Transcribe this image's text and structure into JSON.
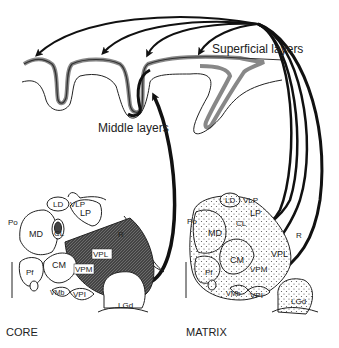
{
  "diagram": {
    "cortex_labels": {
      "superficial": "Superficial layers",
      "middle": "Middle layers"
    },
    "panels": {
      "core": {
        "title": "CORE",
        "nuclei": [
          "LD",
          "VLP",
          "Po",
          "LP",
          "MD",
          "CL",
          "R",
          "VPL",
          "CM",
          "VPM",
          "Pf",
          "VMb",
          "VPI",
          "LGd"
        ],
        "highlighted": [
          "VPL",
          "VPM"
        ],
        "fill": "dark-hatched"
      },
      "matrix": {
        "title": "MATRIX",
        "nuclei": [
          "LD",
          "VLP",
          "Po",
          "LP",
          "MD",
          "CL",
          "R",
          "VPL",
          "CM",
          "VPM",
          "Pf",
          "VMb",
          "VPI",
          "LGd"
        ],
        "fill": "stippled"
      }
    },
    "projections": {
      "core_to": "Middle layers",
      "matrix_to": "Superficial layers"
    },
    "colors": {
      "line": "#111111",
      "cortex_band": "#888888",
      "core_fill": "#3a3a3a"
    }
  }
}
